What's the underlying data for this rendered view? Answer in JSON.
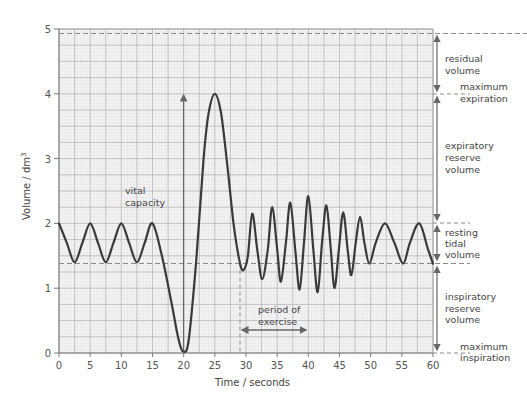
{
  "chart_data": {
    "type": "line",
    "title": "",
    "xlabel": "Time / seconds",
    "ylabel": "Volume / dm³",
    "xlim": [
      0,
      60
    ],
    "ylim": [
      0,
      5
    ],
    "xticks": [
      0,
      5,
      10,
      15,
      20,
      25,
      30,
      35,
      40,
      45,
      50,
      55,
      60
    ],
    "yticks": [
      0,
      1,
      2,
      3,
      4,
      5
    ],
    "grid": true,
    "series": [
      {
        "name": "lung volume trace",
        "points": [
          [
            0,
            2.0
          ],
          [
            1.25,
            1.7
          ],
          [
            2.5,
            1.4
          ],
          [
            3.75,
            1.7
          ],
          [
            5,
            2.0
          ],
          [
            6.25,
            1.7
          ],
          [
            7.5,
            1.4
          ],
          [
            8.75,
            1.7
          ],
          [
            10,
            2.0
          ],
          [
            11.25,
            1.7
          ],
          [
            12.5,
            1.4
          ],
          [
            13.75,
            1.7
          ],
          [
            15,
            2.0
          ],
          [
            16.5,
            1.5
          ],
          [
            18,
            0.8
          ],
          [
            19.2,
            0.2
          ],
          [
            20,
            0.02
          ],
          [
            20.8,
            0.2
          ],
          [
            22,
            1.4
          ],
          [
            23.2,
            3.0
          ],
          [
            24,
            3.7
          ],
          [
            25,
            4.0
          ],
          [
            26,
            3.7
          ],
          [
            27,
            2.9
          ],
          [
            28,
            2.0
          ],
          [
            29,
            1.4
          ],
          [
            29.6,
            1.28
          ],
          [
            30.3,
            1.5
          ],
          [
            31,
            2.15
          ],
          [
            31.8,
            1.6
          ],
          [
            32.6,
            1.14
          ],
          [
            33.5,
            1.6
          ],
          [
            34.2,
            2.25
          ],
          [
            35,
            1.6
          ],
          [
            35.6,
            1.1
          ],
          [
            36.4,
            1.7
          ],
          [
            37.1,
            2.32
          ],
          [
            37.9,
            1.6
          ],
          [
            38.6,
            0.98
          ],
          [
            39.3,
            1.7
          ],
          [
            40,
            2.42
          ],
          [
            40.8,
            1.6
          ],
          [
            41.5,
            0.94
          ],
          [
            42.2,
            1.7
          ],
          [
            42.9,
            2.28
          ],
          [
            43.6,
            1.6
          ],
          [
            44.2,
            1.0
          ],
          [
            44.9,
            1.6
          ],
          [
            45.6,
            2.17
          ],
          [
            46.3,
            1.6
          ],
          [
            46.9,
            1.2
          ],
          [
            47.6,
            1.7
          ],
          [
            48.3,
            2.1
          ],
          [
            49.0,
            1.7
          ],
          [
            49.8,
            1.38
          ],
          [
            50.8,
            1.7
          ],
          [
            52.3,
            2.0
          ],
          [
            53.8,
            1.7
          ],
          [
            55.2,
            1.38
          ],
          [
            56.3,
            1.7
          ],
          [
            57.8,
            2.0
          ],
          [
            59.2,
            1.6
          ],
          [
            60,
            1.38
          ]
        ]
      }
    ],
    "reference_lines": [
      {
        "name": "maximum-expiration-line",
        "y": 4.93,
        "style": "dashed"
      },
      {
        "name": "resting-inspiration-line",
        "y": 1.38,
        "style": "dashed"
      },
      {
        "name": "exercise-start-line",
        "x": 29,
        "y_from": 0,
        "y_to": 1.38,
        "style": "dashed",
        "orientation": "vertical"
      }
    ],
    "annotations": [
      {
        "text": "vital capacity",
        "x": 10.5,
        "y": 2.3,
        "arrow": {
          "x": 20,
          "y_from": 0,
          "y_to": 4
        }
      },
      {
        "text": "period of exercise",
        "x": 31,
        "y": 0.6,
        "arrow": {
          "x_from": 29,
          "x_to": 40,
          "y": 0.37
        }
      },
      {
        "text": "residual volume",
        "side": "right",
        "y_from": 4.93,
        "y_to": 3.98
      },
      {
        "text": "maximum expiration",
        "side": "right",
        "y": 3.98
      },
      {
        "text": "expiratory reserve volume",
        "side": "right",
        "y_from": 3.98,
        "y_to": 2.0
      },
      {
        "text": "resting tidal volume",
        "side": "right",
        "y_from": 2.0,
        "y_to": 1.38
      },
      {
        "text": "inspiratory reserve volume",
        "side": "right",
        "y_from": 1.38,
        "y_to": 0
      },
      {
        "text": "maximum inspiration",
        "side": "right",
        "y": 0
      }
    ]
  },
  "labels": {
    "x_axis_title": "Time / seconds",
    "y_axis_title": "Volume / dm",
    "y_axis_sup": "3",
    "vital_capacity_1": "vital",
    "vital_capacity_2": "capacity",
    "exercise_1": "period of",
    "exercise_2": "exercise",
    "residual_1": "residual",
    "residual_2": "volume",
    "max_exp_1": "maximum",
    "max_exp_2": "expiration",
    "erv_1": "expiratory",
    "erv_2": "reserve",
    "erv_3": "volume",
    "tidal_1": "resting",
    "tidal_2": "tidal",
    "tidal_3": "volume",
    "irv_1": "inspiratory",
    "irv_2": "reserve",
    "irv_3": "volume",
    "max_insp_1": "maximum",
    "max_insp_2": "inspiration"
  },
  "colors": {
    "trace": "#3a3a3a",
    "grid_major": "#b8b8b8",
    "grid_minor": "#e2e2e2",
    "plot_bg": "#f4f4f4",
    "dashed": "#8a8a8a",
    "arrow": "#666666",
    "text": "#444444"
  }
}
